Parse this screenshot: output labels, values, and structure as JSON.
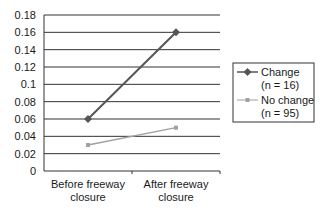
{
  "chart_data": {
    "type": "line",
    "title": "",
    "xlabel": "",
    "ylabel": "",
    "categories": [
      "Before freeway closure",
      "After freeway closure"
    ],
    "category_lines": [
      [
        "Before freeway",
        "closure"
      ],
      [
        "After freeway",
        "closure"
      ]
    ],
    "series": [
      {
        "name": "Change (n = 16)",
        "legend_lines": [
          "Change",
          "(n = 16)"
        ],
        "values": [
          0.06,
          0.16
        ],
        "color": "#555555",
        "marker": "diamond"
      },
      {
        "name": "No change (n = 95)",
        "legend_lines": [
          "No change",
          "(n = 95)"
        ],
        "values": [
          0.03,
          0.05
        ],
        "color": "#a0a0a0",
        "marker": "square"
      }
    ],
    "ylim": [
      0,
      0.18
    ],
    "yticks": [
      "0",
      "0.02",
      "0.04",
      "0.06",
      "0.08",
      "0.1",
      "0.12",
      "0.14",
      "0.16",
      "0.18"
    ],
    "grid": true,
    "legend_position": "right"
  }
}
